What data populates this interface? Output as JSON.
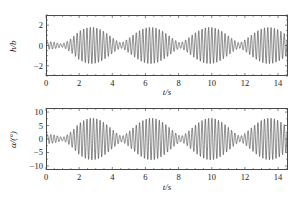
{
  "figure": {
    "background": "#ffffff",
    "line_color": "#2b2b2b",
    "axis_color": "#4a4a4a"
  },
  "chart_data": [
    {
      "id": "panel-top",
      "type": "line",
      "title": "",
      "xlabel": "t/s",
      "ylabel": "h/b",
      "xlim": [
        0,
        14.6
      ],
      "ylim": [
        -3,
        3
      ],
      "xticks": [
        0,
        2,
        4,
        6,
        8,
        10,
        12,
        14
      ],
      "xticklabels": [
        "0",
        "2",
        "4",
        "6",
        "8",
        "10",
        "12",
        "14"
      ],
      "yticks": [
        -2,
        0,
        2
      ],
      "yticklabels": [
        "-2",
        "0",
        "2"
      ],
      "x_minor_tick_step": 0.5,
      "y_minor_tick_step": 0.5,
      "grid": false,
      "legend": "none",
      "series": [
        {
          "name": "h/b",
          "description": "amplitude-modulated (beating) oscillation; carrier frequency about 5.0 Hz with beat envelope period about 3.6 s",
          "carrier_hz": 5.0,
          "beat_period_s": 3.6,
          "envelope_peaks_t": [
            2.7,
            6.3,
            9.9,
            13.5
          ],
          "envelope_peak_amplitude": 1.85,
          "envelope_min_amplitude": 0.28,
          "peak_values": [
            1.9,
            1.8,
            1.85,
            1.8
          ],
          "trough_values": [
            -1.75,
            -1.7,
            -1.8,
            -1.7
          ]
        }
      ]
    },
    {
      "id": "panel-bottom",
      "type": "line",
      "title": "",
      "xlabel": "t/s",
      "ylabel": "α/(°)",
      "xlim": [
        0,
        14.6
      ],
      "ylim": [
        -11.5,
        11.5
      ],
      "xticks": [
        0,
        2,
        4,
        6,
        8,
        10,
        12,
        14
      ],
      "xticklabels": [
        "0",
        "2",
        "4",
        "6",
        "8",
        "10",
        "12",
        "14"
      ],
      "yticks": [
        -10,
        -5,
        0,
        5,
        10
      ],
      "yticklabels": [
        "-10",
        "-5",
        "0",
        "5",
        "10"
      ],
      "x_minor_tick_step": 0.5,
      "y_minor_tick_step": 2.5,
      "grid": false,
      "legend": "none",
      "series": [
        {
          "name": "alpha",
          "description": "amplitude-modulated (beating) pitch oscillation; carrier frequency about 5.0 Hz with beat envelope period about 3.6 s",
          "carrier_hz": 5.0,
          "beat_period_s": 3.6,
          "envelope_peaks_t": [
            2.75,
            6.35,
            9.95,
            13.55
          ],
          "envelope_peak_amplitude": 8.0,
          "envelope_min_amplitude": 1.1,
          "peak_values": [
            8.0,
            8.1,
            7.9,
            8.0
          ],
          "trough_values": [
            -7.6,
            -7.4,
            -7.5,
            -7.5
          ]
        }
      ]
    }
  ]
}
